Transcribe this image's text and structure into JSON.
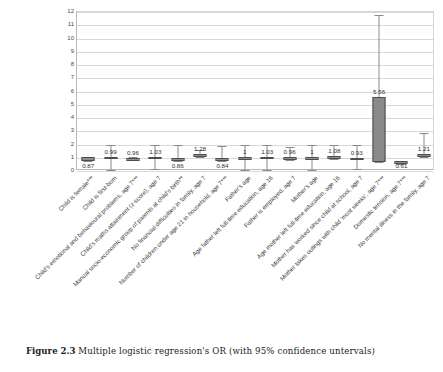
{
  "caption": {
    "figure_number": "Figure 2.3",
    "text": "Multiple logistic regression's OR (with 95% confidence untervals)"
  },
  "chart_data": {
    "type": "bar",
    "title": "",
    "xlabel": "",
    "ylabel": "",
    "ylim": [
      0,
      12
    ],
    "yticks": [
      12,
      11,
      10,
      9,
      8,
      7,
      6,
      5,
      4,
      3,
      2,
      1,
      0
    ],
    "grid": true,
    "legend": "none",
    "categories": [
      "Child is female***",
      "Child is first-born",
      "Child's emotional and behavioural problems, age 7***",
      "Child's maths attainment (z-score), age 7",
      "Manual socio-economic group of parents at child's birth**",
      "No financial difficulties in family, age 7",
      "Number of children under age 21 in household, age 7***",
      "Father's age",
      "Age father left full-time education, age 16",
      "Father is employed, age 7",
      "Mother's age",
      "Age mother left full-time education, age 16",
      "Mother has worked since child at school, age 7",
      "Mother takes outings with child 'most weeks', age 7***",
      "Domestic tension, age 7***",
      "No mental illness in the family, age 7"
    ],
    "values": [
      0.87,
      0.99,
      0.96,
      1.03,
      0.86,
      1.28,
      0.84,
      1,
      1.03,
      0.96,
      1,
      1.08,
      0.93,
      5.56,
      0.61,
      1.21
    ],
    "value_labels": [
      "0.87",
      "0.99",
      "0.96",
      "1.03",
      "0.86",
      "1.28",
      "0.84",
      "1",
      "1.03",
      "0.96",
      "1",
      "1.08",
      "0.93",
      "5.56",
      "0.61",
      "1.21"
    ],
    "ci_low": [
      0.74,
      0.1,
      0.9,
      0.15,
      0.75,
      1.05,
      0.72,
      0.08,
      0.1,
      0.86,
      0.08,
      0.94,
      0.12,
      0.7,
      0.52,
      1.02
    ],
    "ci_high": [
      1.02,
      1.96,
      1.02,
      1.97,
      1.93,
      1.58,
      1.87,
      1.95,
      1.96,
      1.78,
      1.93,
      1.95,
      1.95,
      11.75,
      0.74,
      2.88
    ],
    "box_low": [
      0.74,
      0.92,
      0.96,
      0.96,
      0.76,
      1.05,
      0.75,
      0.96,
      0.96,
      0.9,
      0.96,
      0.99,
      0.9,
      0.7,
      0.52,
      1.02
    ],
    "box_high": [
      1.02,
      1.06,
      0.98,
      1.06,
      0.96,
      1.3,
      0.95,
      1.04,
      1.06,
      1.02,
      1.04,
      1.12,
      1.0,
      5.56,
      0.74,
      1.25
    ],
    "label_position": [
      "below",
      "above",
      "above",
      "above",
      "below",
      "above",
      "below",
      "above",
      "above",
      "above",
      "above",
      "above",
      "above",
      "above",
      "below",
      "above"
    ]
  },
  "axis": {
    "y_max_label": "12",
    "y_min_label": "0"
  }
}
